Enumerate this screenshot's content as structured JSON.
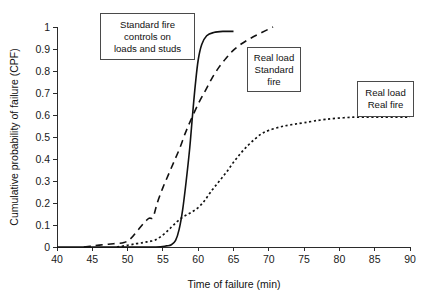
{
  "chart_data": {
    "type": "line",
    "title": "",
    "xlabel": "Time of failure (min)",
    "ylabel": "Cumulative probability of failure (CPF)",
    "xlim": [
      40,
      90
    ],
    "ylim": [
      0,
      1
    ],
    "xticks": [
      40,
      45,
      50,
      55,
      60,
      65,
      70,
      75,
      80,
      85,
      90
    ],
    "xtick_labels": [
      "40",
      "45",
      "50",
      "55",
      "60",
      "65",
      "70",
      "75",
      "80",
      "85",
      "90"
    ],
    "yticks": [
      0,
      0.1,
      0.2,
      0.3,
      0.4,
      0.5,
      0.6,
      0.7,
      0.8,
      0.9,
      1
    ],
    "ytick_labels": [
      "0",
      "0.1",
      "0.2",
      "0.3",
      "0.4",
      "0.5",
      "0.6",
      "0.7",
      "0.8",
      "0.9",
      "1"
    ],
    "grid": false,
    "legend_position": "annotation-boxes",
    "series": [
      {
        "name": "Standard fire controls on loads and studs",
        "style": "solid",
        "x": [
          40,
          50,
          54,
          55.5,
          56.2,
          56.8,
          57.3,
          57.8,
          58.3,
          58.8,
          59.2,
          59.6,
          60.0,
          60.5,
          61.2,
          62.2,
          63.5,
          65.0
        ],
        "y": [
          0,
          0,
          0,
          0.005,
          0.01,
          0.03,
          0.08,
          0.17,
          0.3,
          0.45,
          0.6,
          0.74,
          0.85,
          0.92,
          0.96,
          0.975,
          0.98,
          0.98
        ]
      },
      {
        "name": "Real load Standard fire",
        "style": "dashed",
        "x": [
          43.8,
          45.0,
          46.5,
          48.0,
          49.5,
          50.5,
          51.3,
          52.2,
          53.0,
          53.6,
          54.2,
          55.0,
          55.8,
          56.6,
          57.4,
          58.2,
          59.0,
          60.0,
          61.0,
          62.0,
          63.0,
          64.0,
          65.0,
          66.2,
          67.5,
          69.0,
          70.6
        ],
        "y": [
          0,
          0.005,
          0.01,
          0.015,
          0.02,
          0.04,
          0.07,
          0.105,
          0.13,
          0.135,
          0.2,
          0.27,
          0.33,
          0.39,
          0.45,
          0.52,
          0.58,
          0.65,
          0.71,
          0.77,
          0.82,
          0.86,
          0.895,
          0.925,
          0.95,
          0.975,
          1.0
        ]
      },
      {
        "name": "Real load Real fire",
        "style": "dotted",
        "x": [
          48.5,
          50.0,
          51.2,
          52.2,
          53.0,
          53.8,
          54.6,
          55.4,
          56.2,
          57.0,
          57.8,
          58.6,
          59.4,
          60.2,
          61.0,
          62.0,
          63.0,
          64.0,
          65.0,
          66.0,
          67.0,
          68.0,
          69.0,
          70.0,
          71.5,
          73.0,
          75.0,
          78.0,
          82.0,
          86.0,
          90.0
        ],
        "y": [
          0,
          0.008,
          0.015,
          0.02,
          0.025,
          0.03,
          0.045,
          0.065,
          0.09,
          0.115,
          0.135,
          0.15,
          0.165,
          0.185,
          0.215,
          0.26,
          0.3,
          0.34,
          0.385,
          0.425,
          0.46,
          0.49,
          0.515,
          0.53,
          0.545,
          0.555,
          0.565,
          0.58,
          0.59,
          0.59,
          0.59
        ]
      }
    ],
    "annotations": [
      {
        "id": "standard-fire-controls",
        "lines": [
          "Standard fire",
          "controls on",
          "loads and studs"
        ],
        "box": {
          "left": 100,
          "top": 13,
          "width": 95,
          "height": 47
        }
      },
      {
        "id": "real-load-standard-fire",
        "lines": [
          "Real load",
          "Standard",
          "fire"
        ],
        "box": {
          "left": 247,
          "top": 47,
          "width": 54,
          "height": 45
        }
      },
      {
        "id": "real-load-real-fire",
        "lines": [
          "Real load",
          "Real fire"
        ],
        "box": {
          "left": 357,
          "top": 81,
          "width": 57,
          "height": 36
        }
      }
    ]
  }
}
